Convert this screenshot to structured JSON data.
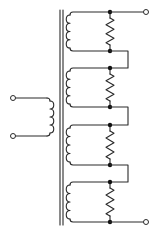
{
  "title": "Transformer with four series-connected secondary windings, each shunted by a resistor",
  "primary": {
    "terminals": [
      {
        "name": "primary-terminal-top",
        "x": 13,
        "y": 98
      },
      {
        "name": "primary-terminal-bottom",
        "x": 13,
        "y": 136
      }
    ],
    "coil_x": 50,
    "coil_top": 98,
    "coil_bottom": 136,
    "turns": 4
  },
  "core": {
    "lines_x": [
      60,
      63
    ],
    "top": 10,
    "bottom": 225
  },
  "secondary": {
    "coil_x": 70,
    "resistor_x": 110,
    "jumper_x": 128,
    "turns": 4,
    "sections": [
      {
        "top": 12,
        "bottom": 51
      },
      {
        "top": 68,
        "bottom": 107
      },
      {
        "top": 125,
        "bottom": 165
      },
      {
        "top": 182,
        "bottom": 222
      }
    ],
    "output_terminals": [
      {
        "name": "output-terminal-top",
        "x": 146,
        "y": 12
      },
      {
        "name": "output-terminal-bottom",
        "x": 146,
        "y": 222
      }
    ]
  },
  "colors": {
    "line": "#2a2a2a",
    "background": "#ffffff"
  }
}
